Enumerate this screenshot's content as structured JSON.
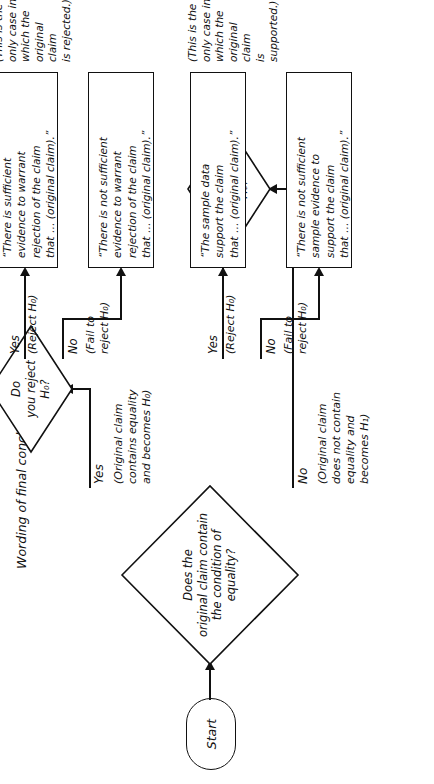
{
  "figure": {
    "title": "Wording of final conclusion",
    "orientation": "rotated-90-ccw"
  },
  "nodes": {
    "start": {
      "label": "Start"
    },
    "decision_equality": {
      "text": "Does the\noriginal claim contain\nthe condition of\nequality?"
    },
    "decision_reject_top": {
      "text": "Do\nyou reject\nH₀?"
    },
    "decision_reject_bottom": {
      "text": "Do\nyou reject\nH₀?"
    }
  },
  "edge_labels": {
    "equality_yes": "Yes",
    "equality_yes_note": "(Original claim\ncontains equality\nand becomes H₀)",
    "equality_no": "No",
    "equality_no_note": "(Original claim\ndoes not contain\nequality and\nbecomes H₁)",
    "top_yes": "Yes",
    "top_yes_note": "(Reject H₀)",
    "top_no": "No",
    "top_no_note": "(Fail to\nreject H₀)",
    "bottom_yes": "Yes",
    "bottom_yes_note": "(Reject H₀)",
    "bottom_no": "No",
    "bottom_no_note": "(Fail to\nreject H₀)"
  },
  "conclusions": [
    {
      "id": "box1",
      "text": "“There is sufficient\nevidence to warrant\nrejection of the claim\nthat … (original claim).”",
      "note": "(This is the\nonly case in\nwhich the\noriginal claim\nis rejected.)"
    },
    {
      "id": "box2",
      "text": "“There is not sufficient\nevidence to warrant\nrejection of the claim\nthat … (original claim).”",
      "note": ""
    },
    {
      "id": "box3",
      "text": "“The sample data\nsupport the claim\nthat … (original claim).”",
      "note": "(This is the\nonly case in\nwhich the\noriginal claim\nis supported.)"
    },
    {
      "id": "box4",
      "text": "“There is not sufficient\nsample evidence to\nsupport the claim\nthat … (original claim).”",
      "note": ""
    }
  ],
  "colors": {
    "ink": "#111111",
    "paper": "#ffffff"
  }
}
